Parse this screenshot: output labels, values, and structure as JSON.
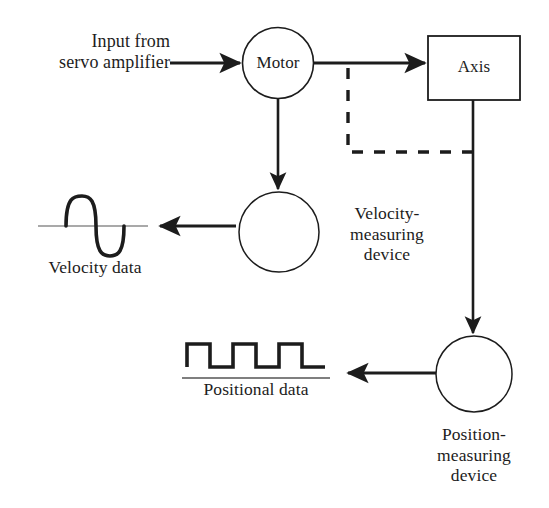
{
  "diagram": {
    "background_color": "#ffffff",
    "stroke_color": "#1c1c1c",
    "nodes": {
      "motor": {
        "label": "Motor",
        "shape": "circle"
      },
      "axis": {
        "label": "Axis",
        "shape": "rectangle"
      },
      "velocity_device": {
        "label_line1": "Velocity-",
        "label_line2": "measuring",
        "label_line3": "device",
        "shape": "circle"
      },
      "position_device": {
        "label_line1": "Position-",
        "label_line2": "measuring",
        "label_line3": "device",
        "shape": "circle"
      }
    },
    "input": {
      "line1": "Input from",
      "line2": "servo amplifier"
    },
    "outputs": {
      "velocity_data": {
        "label": "Velocity data",
        "waveform": "sine"
      },
      "positional_data": {
        "label": "Positional data",
        "waveform": "square",
        "pulses": 3
      }
    },
    "connections": [
      {
        "name": "input-to-motor",
        "style": "solid",
        "arrow": true
      },
      {
        "name": "motor-to-axis",
        "style": "solid",
        "arrow": true
      },
      {
        "name": "motor-to-velocity-device",
        "style": "solid",
        "arrow": true
      },
      {
        "name": "axis-to-position-device",
        "style": "solid",
        "arrow": true
      },
      {
        "name": "axis-feedback-to-motor-branch",
        "style": "dashed",
        "arrow": false
      },
      {
        "name": "velocity-device-to-velocity-data",
        "style": "solid",
        "arrow": true
      },
      {
        "name": "position-device-to-positional-data",
        "style": "solid",
        "arrow": true
      }
    ]
  }
}
